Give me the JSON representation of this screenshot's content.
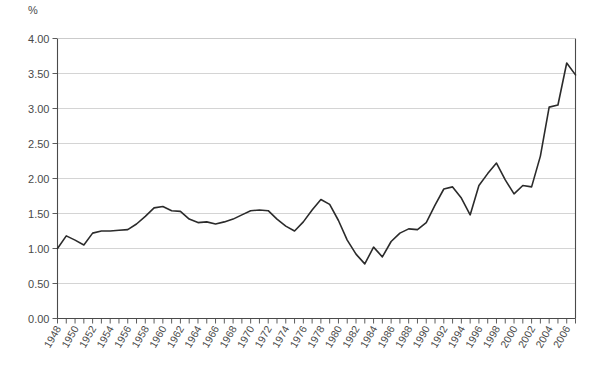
{
  "partial_title": "",
  "axes": {
    "y_unit_label": "%",
    "y_ticks": [
      "0.00",
      "0.50",
      "1.00",
      "1.50",
      "2.00",
      "2.50",
      "3.00",
      "3.50",
      "4.00"
    ],
    "x_ticks": [
      "1948",
      "1950",
      "1952",
      "1954",
      "1956",
      "1958",
      "1960",
      "1962",
      "1964",
      "1966",
      "1968",
      "1970",
      "1972",
      "1974",
      "1976",
      "1978",
      "1980",
      "1982",
      "1984",
      "1986",
      "1988",
      "1990",
      "1992",
      "1994",
      "1996",
      "1998",
      "2000",
      "2002",
      "2004",
      "2006"
    ]
  },
  "colors": {
    "line": "#2b2b2b",
    "grid": "#c9c9c9",
    "axis": "#4a4a4a",
    "background": "#ffffff"
  },
  "chart_data": {
    "type": "line",
    "title": "",
    "subtitle": "",
    "xlabel": "",
    "ylabel": "%",
    "ylim": [
      0.0,
      4.0
    ],
    "xlim": [
      1948,
      2007
    ],
    "y_tick_step": 0.5,
    "grid": "horizontal",
    "legend": "none",
    "x": [
      1948,
      1949,
      1950,
      1951,
      1952,
      1953,
      1954,
      1955,
      1956,
      1957,
      1958,
      1959,
      1960,
      1961,
      1962,
      1963,
      1964,
      1965,
      1966,
      1967,
      1968,
      1969,
      1970,
      1971,
      1972,
      1973,
      1974,
      1975,
      1976,
      1977,
      1978,
      1979,
      1980,
      1981,
      1982,
      1983,
      1984,
      1985,
      1986,
      1987,
      1988,
      1989,
      1990,
      1991,
      1992,
      1993,
      1994,
      1995,
      1996,
      1997,
      1998,
      1999,
      2000,
      2001,
      2002,
      2003,
      2004,
      2005,
      2006,
      2007
    ],
    "series": [
      {
        "name": "value",
        "values": [
          1.0,
          1.18,
          1.12,
          1.05,
          1.22,
          1.25,
          1.25,
          1.26,
          1.27,
          1.35,
          1.46,
          1.58,
          1.6,
          1.54,
          1.53,
          1.42,
          1.37,
          1.38,
          1.35,
          1.38,
          1.42,
          1.48,
          1.54,
          1.55,
          1.54,
          1.42,
          1.32,
          1.25,
          1.38,
          1.55,
          1.7,
          1.63,
          1.4,
          1.12,
          0.92,
          0.78,
          1.02,
          0.88,
          1.1,
          1.22,
          1.28,
          1.27,
          1.37,
          1.62,
          1.85,
          1.88,
          1.72,
          1.48,
          1.9,
          2.07,
          2.22,
          1.98,
          1.78,
          1.9,
          1.88,
          2.32,
          3.02,
          3.05,
          3.65,
          3.48
        ]
      }
    ]
  }
}
